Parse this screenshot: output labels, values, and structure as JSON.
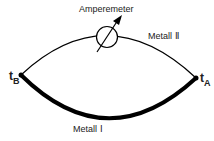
{
  "labels": {
    "amperemeter": "Amperemeter",
    "metal2": "Metall Ⅱ",
    "metal1": "Metall Ⅰ",
    "tB_main": "t",
    "tB_sub": "B",
    "tA_main": "t",
    "tA_sub": "A"
  },
  "colors": {
    "line": "#000000",
    "text": "#222222"
  }
}
